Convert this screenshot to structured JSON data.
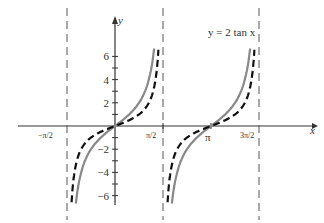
{
  "chart_data": {
    "type": "line",
    "title": "y = 2 tan x",
    "xlabel": "x",
    "ylabel": "y",
    "ylim": [
      -7,
      7
    ],
    "xlim": [
      -1.7,
      5.2
    ],
    "x_ticks": [
      "-π/2",
      "π/2",
      "π",
      "3π/2"
    ],
    "y_ticks": [
      -6,
      -4,
      -2,
      2,
      4,
      6
    ],
    "asymptotes": [
      "-π/2",
      "π/2",
      "3π/2"
    ],
    "series": [
      {
        "name": "y = 2 tan x",
        "style": "solid gray",
        "function": "2*tan(x)"
      },
      {
        "name": "y = tan x",
        "style": "dashed black",
        "function": "tan(x)"
      }
    ]
  },
  "labels": {
    "title": "y = 2 tan x",
    "x": "x",
    "y": "y",
    "pi": "π",
    "neg_pi2": "−π/2",
    "pi2": "π/2",
    "three_pi2": "3π/2"
  }
}
